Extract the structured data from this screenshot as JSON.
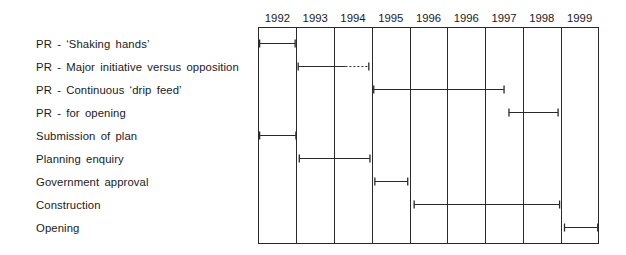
{
  "chart_data": {
    "type": "gantt",
    "title": "",
    "columns": [
      "1992",
      "1993",
      "1994",
      "1995",
      "1996",
      "1996",
      "1997",
      "1998",
      "1999"
    ],
    "rows": [
      {
        "label": "PR - ‘Shaking hands’",
        "start": 0.03,
        "end": 0.97
      },
      {
        "label": "PR - Major initiative versus opposition",
        "start": 1.05,
        "end": 2.3,
        "dotted_end": 2.92
      },
      {
        "label": "PR - Continuous ‘drip feed’",
        "start": 3.05,
        "end": 6.5
      },
      {
        "label": "PR - for opening",
        "start": 6.63,
        "end": 7.93
      },
      {
        "label": "Submission of plan",
        "start": 0.03,
        "end": 0.99
      },
      {
        "label": "Planning enquiry",
        "start": 1.08,
        "end": 2.95
      },
      {
        "label": "Government approval",
        "start": 3.08,
        "end": 3.95
      },
      {
        "label": "Construction",
        "start": 4.12,
        "end": 7.97
      },
      {
        "label": "Opening",
        "start": 8.1,
        "end": 8.98
      }
    ],
    "grid": true,
    "legend": "none"
  }
}
